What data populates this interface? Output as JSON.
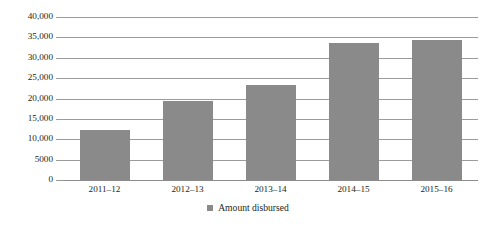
{
  "chart_data": {
    "type": "bar",
    "title": "",
    "xlabel": "",
    "ylabel": "",
    "categories": [
      "2011–12",
      "2012–13",
      "2013–14",
      "2014–15",
      "2015–16"
    ],
    "series": [
      {
        "name": "Amount disbursed",
        "values": [
          12200,
          19400,
          23300,
          33600,
          34400
        ],
        "color": "#8a8a8a"
      }
    ],
    "ylim": [
      0,
      40000
    ],
    "ytick_values": [
      0,
      5000,
      10000,
      15000,
      20000,
      25000,
      30000,
      35000,
      40000
    ],
    "ytick_labels": [
      "0",
      "5000",
      "10,000",
      "15,000",
      "20,000",
      "25,000",
      "30,000",
      "35,000",
      "40,000"
    ],
    "grid": true,
    "grid_axis": "y",
    "grid_color": "#9b9b9b",
    "legend": {
      "position": "bottom-center",
      "entries": [
        {
          "label": "Amount disbursed",
          "marker": "square",
          "color": "#8a8a8a"
        }
      ]
    },
    "background_color": "#ffffff",
    "text_color": "#231f20"
  }
}
